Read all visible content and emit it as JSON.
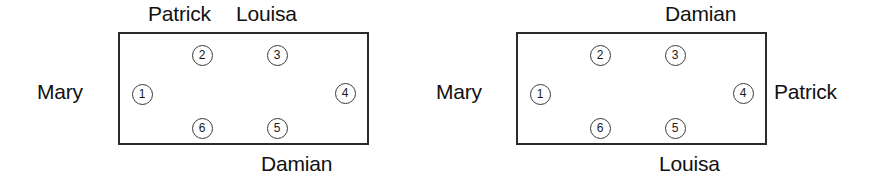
{
  "figure": {
    "type": "seating-arrangement-diagram",
    "diagram_count": 2,
    "seat_numbers": [
      "1",
      "2",
      "3",
      "4",
      "5",
      "6"
    ],
    "colors": {
      "table_border": "#2b2b2b",
      "seat_border": "#3a3a3a",
      "text": "#111111",
      "background": "#ffffff"
    }
  },
  "diagrams": [
    {
      "id": "left",
      "labels": {
        "west": "Mary",
        "top_left": "Patrick",
        "top_right": "Louisa",
        "bottom_right": "Damian"
      },
      "seats": [
        {
          "number": "1",
          "position": "west"
        },
        {
          "number": "2",
          "position": "north-left"
        },
        {
          "number": "3",
          "position": "north-right"
        },
        {
          "number": "4",
          "position": "east"
        },
        {
          "number": "5",
          "position": "south-right"
        },
        {
          "number": "6",
          "position": "south-left"
        }
      ]
    },
    {
      "id": "right",
      "labels": {
        "west": "Mary",
        "north": "Damian",
        "east": "Patrick",
        "south": "Louisa"
      },
      "seats": [
        {
          "number": "1",
          "position": "west"
        },
        {
          "number": "2",
          "position": "north-left"
        },
        {
          "number": "3",
          "position": "north-right"
        },
        {
          "number": "4",
          "position": "east"
        },
        {
          "number": "5",
          "position": "south-right"
        },
        {
          "number": "6",
          "position": "south-left"
        }
      ]
    }
  ]
}
